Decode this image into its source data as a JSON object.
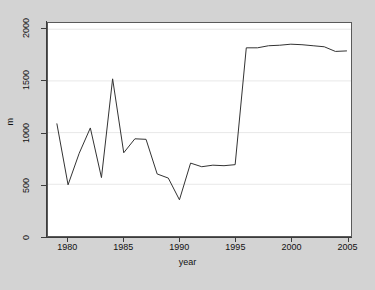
{
  "chart_data": {
    "type": "line",
    "title": "",
    "xlabel": "year",
    "ylabel": "m",
    "xlim": [
      1978.2,
      2005.4
    ],
    "ylim": [
      0,
      2060
    ],
    "xticks": [
      1980,
      1985,
      1990,
      1995,
      2000,
      2005
    ],
    "yticks": [
      0,
      500,
      1000,
      1500,
      2000
    ],
    "xtick_labels": [
      "1980",
      "1985",
      "1990",
      "1995",
      "2000",
      "2005"
    ],
    "ytick_labels": [
      "0",
      "500",
      "1000",
      "1500",
      "2000"
    ],
    "grid": "horizontal",
    "legend": "none",
    "line_color": "#333333",
    "plot_bg": "#ffffff",
    "page_bg": "#d3d3d3",
    "series": [
      {
        "name": "m",
        "x": [
          1979,
          1980,
          1981,
          1982,
          1983,
          1984,
          1985,
          1986,
          1987,
          1988,
          1989,
          1990,
          1991,
          1992,
          1993,
          1994,
          1995,
          1996,
          1997,
          1998,
          1999,
          2000,
          2001,
          2002,
          2003,
          2004,
          2005
        ],
        "values": [
          1085,
          495,
          800,
          1045,
          565,
          1520,
          805,
          940,
          935,
          600,
          560,
          350,
          705,
          670,
          685,
          680,
          690,
          1820,
          1820,
          1840,
          1845,
          1855,
          1850,
          1840,
          1830,
          1785,
          1790
        ]
      }
    ]
  }
}
